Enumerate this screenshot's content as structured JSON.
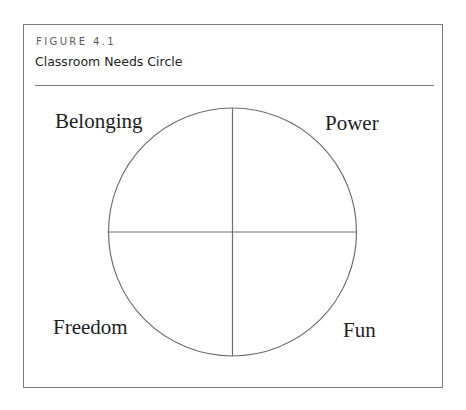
{
  "figure": {
    "number": "FIGURE 4.1",
    "title": "Classroom Needs Circle"
  },
  "diagram": {
    "type": "quadrant-circle",
    "quadrants": [
      {
        "position": "top-left",
        "label": "Belonging"
      },
      {
        "position": "top-right",
        "label": "Power"
      },
      {
        "position": "bottom-left",
        "label": "Freedom"
      },
      {
        "position": "bottom-right",
        "label": "Fun"
      }
    ],
    "colors": {
      "stroke": "#6e6e6e",
      "border": "#7a7a7a",
      "text": "#1e1e1e",
      "caption": "#5a5a5a"
    }
  }
}
